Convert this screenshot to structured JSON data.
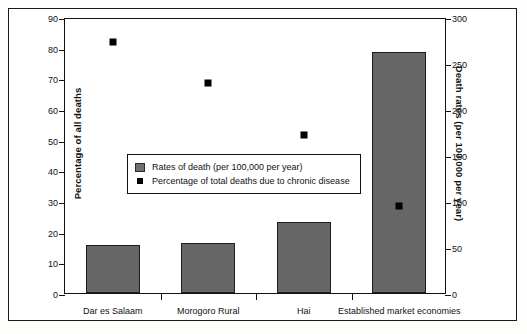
{
  "chart_data": {
    "type": "bar",
    "title": "",
    "categories": [
      "Dar es Salaam",
      "Morogoro Rural",
      "Hai",
      "Established market economies"
    ],
    "series": [
      {
        "name": "Rates of death (per 100,000 per year)",
        "axis": "right",
        "type": "bar",
        "values": [
          52,
          54,
          77,
          262
        ]
      },
      {
        "name": "Percentage of total deaths due to chronic disease",
        "axis": "left",
        "type": "scatter",
        "values": [
          82,
          68.5,
          51.5,
          28.5
        ]
      }
    ],
    "left_axis": {
      "label": "Percentage of all deaths",
      "ylim": [
        0,
        90
      ],
      "ticks": [
        0,
        10,
        20,
        30,
        40,
        50,
        60,
        70,
        80,
        90
      ],
      "tick_labels": [
        "0",
        "10",
        "20",
        "30",
        "40",
        "50",
        "60",
        "70",
        "80",
        "90"
      ]
    },
    "right_axis": {
      "label": "Death rates (per 100,000 per year)",
      "ylim": [
        0,
        300
      ],
      "ticks": [
        0,
        50,
        100,
        150,
        200,
        250,
        300
      ],
      "tick_labels": [
        "0",
        "50",
        "100",
        "150",
        "200",
        "250",
        "300"
      ]
    },
    "xlabel": "",
    "grid": false,
    "legend": {
      "position": "inside-left-middle",
      "entries": [
        {
          "marker": "bar-swatch",
          "label": "Rates of death (per 100,000 per year)"
        },
        {
          "marker": "square-point",
          "label": "Percentage of total deaths due to chronic disease"
        }
      ]
    },
    "colors": {
      "bar_fill": "#666666",
      "bar_edge": "#1d1d1d",
      "marker": "#000000",
      "axis": "#111111",
      "background": "#ffffff"
    }
  }
}
